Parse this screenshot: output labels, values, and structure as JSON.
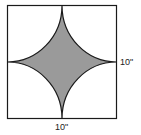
{
  "figure": {
    "type": "geometry",
    "labels": {
      "right_side": "10\"",
      "bottom_side": "10\""
    },
    "colors": {
      "stroke": "#1a1a1a",
      "shaded": "#9a9a9a",
      "background": "#ffffff"
    }
  }
}
